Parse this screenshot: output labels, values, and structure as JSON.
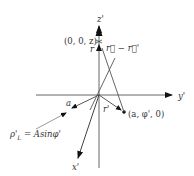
{
  "diagram": {
    "axes": {
      "z_label": "z'",
      "y_label": "y'",
      "x_label": "x'"
    },
    "points": {
      "axis_point": "(0, 0, z)",
      "ring_point": "(a, φ', 0)"
    },
    "vectors": {
      "r": "r⃗",
      "r_prime": "r⃗'",
      "r_minus_r_prime": "r⃗ − r⃗'",
      "radius": "a"
    },
    "annotation": "ρ'L = A sinφ'",
    "annotation_parts": {
      "rho": "ρ'",
      "sub": "L",
      "rhs": " = Asinφ'"
    },
    "colors": {
      "line": "#555555",
      "arrow": "#111111",
      "text": "#333333"
    }
  }
}
